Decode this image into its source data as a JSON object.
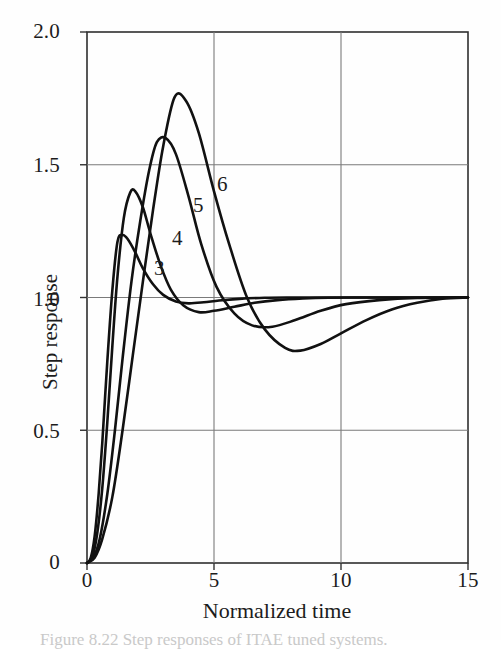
{
  "figure": {
    "background_color": "#fefefe",
    "line_color": "#111111",
    "grid_color": "#7a7a7a",
    "axis_color": "#333333",
    "caption": "Figure 8.22 Step responses of ITAE tuned systems."
  },
  "axes": {
    "ylabel": "Step response",
    "xlabel": "Normalized time",
    "ytick_labels": [
      "2.0",
      "1.5",
      "1.0",
      "0.5",
      "0"
    ],
    "xtick_labels": [
      "0",
      "5",
      "10",
      "15"
    ]
  },
  "curve_tags": [
    {
      "label": "3"
    },
    {
      "label": "4"
    },
    {
      "label": "5"
    },
    {
      "label": "6"
    }
  ],
  "chart_data": {
    "type": "line",
    "title": "",
    "xlabel": "Normalized time",
    "ylabel": "Step response",
    "xlim": [
      0,
      15
    ],
    "ylim": [
      0,
      2.0
    ],
    "xticks": [
      0,
      5,
      10,
      15
    ],
    "yticks": [
      0,
      0.5,
      1.0,
      1.5,
      2.0
    ],
    "grid": true,
    "gridlines_x": [
      5,
      10
    ],
    "gridlines_y": [
      0.5,
      1.0,
      1.5
    ],
    "legend": "inline labels on curves",
    "annotations": [
      {
        "text": "3",
        "x": 2.85,
        "y": 1.11
      },
      {
        "text": "4",
        "x": 3.55,
        "y": 1.22
      },
      {
        "text": "5",
        "x": 4.35,
        "y": 1.34
      },
      {
        "text": "6",
        "x": 5.3,
        "y": 1.41
      }
    ],
    "series": [
      {
        "name": "3",
        "label": "3",
        "overshoot_peak": 1.24,
        "peak_time": 1.2,
        "x": [
          0,
          0.15,
          0.3,
          0.45,
          0.6,
          0.8,
          1.0,
          1.2,
          1.4,
          1.6,
          1.9,
          2.2,
          2.6,
          3.0,
          3.5,
          4.0,
          4.6,
          5.2,
          6.0,
          7.0,
          8.0,
          9.0,
          10.0,
          11.5,
          13.0,
          15.0
        ],
        "y": [
          0.0,
          0.02,
          0.1,
          0.25,
          0.45,
          0.76,
          1.03,
          1.21,
          1.235,
          1.22,
          1.17,
          1.11,
          1.05,
          1.01,
          0.985,
          0.978,
          0.982,
          0.989,
          0.995,
          0.999,
          1.0,
          1.0,
          1.0,
          1.0,
          1.0,
          1.0
        ]
      },
      {
        "name": "4",
        "label": "4",
        "overshoot_peak": 1.4,
        "peak_time": 1.8,
        "x": [
          0,
          0.2,
          0.4,
          0.6,
          0.8,
          1.0,
          1.2,
          1.45,
          1.7,
          1.9,
          2.2,
          2.5,
          2.9,
          3.3,
          3.8,
          4.4,
          5.0,
          5.8,
          6.6,
          7.5,
          8.5,
          9.5,
          11.0,
          12.5,
          15.0
        ],
        "y": [
          0.0,
          0.02,
          0.11,
          0.28,
          0.53,
          0.82,
          1.08,
          1.3,
          1.395,
          1.4,
          1.34,
          1.24,
          1.12,
          1.03,
          0.97,
          0.945,
          0.95,
          0.965,
          0.98,
          0.99,
          0.996,
          0.999,
          1.0,
          1.0,
          1.0
        ]
      },
      {
        "name": "5",
        "label": "5",
        "overshoot_peak": 1.6,
        "peak_time": 2.75,
        "x": [
          0,
          0.25,
          0.5,
          0.8,
          1.1,
          1.4,
          1.75,
          2.1,
          2.45,
          2.75,
          3.1,
          3.5,
          4.0,
          4.5,
          5.1,
          5.8,
          6.5,
          7.3,
          8.2,
          9.2,
          10.2,
          11.5,
          13.0,
          15.0
        ],
        "y": [
          0.0,
          0.02,
          0.09,
          0.26,
          0.5,
          0.77,
          1.06,
          1.29,
          1.48,
          1.585,
          1.6,
          1.54,
          1.38,
          1.2,
          1.04,
          0.94,
          0.895,
          0.89,
          0.915,
          0.95,
          0.975,
          0.99,
          0.998,
          1.0
        ]
      },
      {
        "name": "6",
        "label": "6",
        "overshoot_peak": 1.76,
        "peak_time": 3.45,
        "undershoot_min": 0.8,
        "undershoot_time": 8.2,
        "x": [
          0,
          0.3,
          0.6,
          1.0,
          1.4,
          1.8,
          2.2,
          2.6,
          3.0,
          3.45,
          3.9,
          4.4,
          5.0,
          5.6,
          6.3,
          7.0,
          7.8,
          8.4,
          9.2,
          10.0,
          11.0,
          12.0,
          13.0,
          14.0,
          15.0
        ],
        "y": [
          0.0,
          0.02,
          0.09,
          0.25,
          0.5,
          0.78,
          1.06,
          1.33,
          1.57,
          1.755,
          1.74,
          1.62,
          1.4,
          1.2,
          1.0,
          0.88,
          0.81,
          0.8,
          0.825,
          0.865,
          0.915,
          0.955,
          0.98,
          0.995,
          1.0
        ]
      }
    ]
  }
}
